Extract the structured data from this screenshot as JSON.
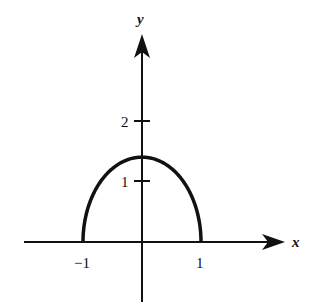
{
  "chart_data": {
    "type": "line",
    "title": "",
    "xlabel": "x",
    "ylabel": "y",
    "x_ticks": [
      {
        "value": -1,
        "label": "−1"
      },
      {
        "value": 1,
        "label": "1"
      }
    ],
    "y_ticks": [
      {
        "value": 1,
        "label": "1"
      },
      {
        "value": 2,
        "label": "2"
      }
    ],
    "xlim": [
      -2,
      2.4
    ],
    "ylim": [
      -1,
      3.5
    ],
    "grid": false,
    "legend": null,
    "series": [
      {
        "name": "upper half of ellipse x^2 + y^2/2 = 1",
        "x": [
          -1,
          -0.9,
          -0.75,
          -0.5,
          -0.25,
          0,
          0.25,
          0.5,
          0.75,
          0.9,
          1
        ],
        "y": [
          0,
          0.62,
          0.94,
          1.22,
          1.37,
          1.41,
          1.37,
          1.22,
          0.94,
          0.62,
          0
        ]
      }
    ],
    "annotations": []
  },
  "colors": {
    "stroke": "#111111",
    "background": "#ffffff"
  }
}
